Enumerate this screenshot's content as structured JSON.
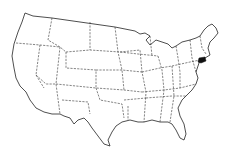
{
  "map": {
    "title": "United States",
    "highlighted_state": "Connecticut",
    "colors": {
      "background": "#ffffff",
      "outline": "#222222",
      "highlight": "#111111"
    }
  }
}
